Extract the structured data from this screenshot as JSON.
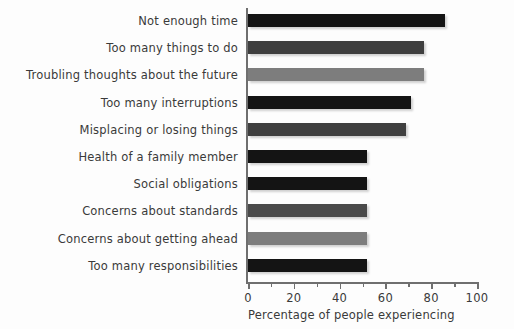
{
  "chart_data": {
    "type": "bar",
    "orientation": "horizontal",
    "title": "",
    "xlabel": "Percentage of people experiencing",
    "ylabel": "",
    "xlim": [
      0,
      100
    ],
    "grid": false,
    "legend": null,
    "categories": [
      "Not enough time",
      "Too many things to do",
      "Troubling thoughts about the future",
      "Too many interruptions",
      "Misplacing or losing things",
      "Health of a family member",
      "Social obligations",
      "Concerns about standards",
      "Concerns about getting ahead",
      "Too many responsibilities"
    ],
    "values": [
      86,
      77,
      77,
      71,
      69,
      52,
      52,
      52,
      52,
      52
    ],
    "bar_colors": [
      "#141414",
      "#3f3f3f",
      "#7d7d7d",
      "#141414",
      "#3f3f3f",
      "#141414",
      "#141414",
      "#4a4a4a",
      "#7d7d7d",
      "#141414"
    ],
    "x_ticks_major": [
      0,
      20,
      40,
      60,
      80,
      100
    ],
    "x_ticks_major_labels": [
      "0",
      "20",
      "40",
      "60",
      "80",
      "100"
    ],
    "x_ticks_minor": [
      10,
      30,
      50,
      70,
      90
    ],
    "axis_color": "#6f6f6f"
  }
}
